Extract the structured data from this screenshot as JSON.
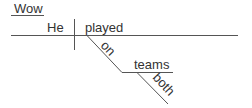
{
  "diagram": {
    "type": "sentence-diagram",
    "words": {
      "interjection": "Wow",
      "subject": "He",
      "verb": "played",
      "preposition": "on",
      "object": "teams",
      "modifier": "both"
    },
    "colors": {
      "text": "#333333",
      "line": "#555555",
      "background": "#ffffff"
    }
  }
}
